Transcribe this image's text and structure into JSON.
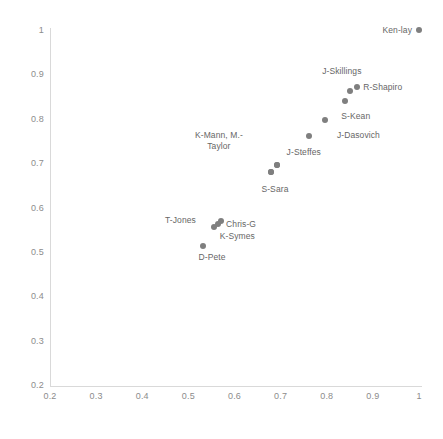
{
  "chart_data": {
    "type": "scatter",
    "title": "",
    "xlabel": "",
    "ylabel": "",
    "xlim": [
      0.2,
      1.0
    ],
    "ylim": [
      0.2,
      1.0
    ],
    "grid": false,
    "legend": "none",
    "marker_color": "#7f7f7f",
    "x_ticks": [
      "0.2",
      "0.3",
      "0.4",
      "0.5",
      "0.6",
      "0.7",
      "0.8",
      "0.9",
      "1"
    ],
    "x_tick_values": [
      0.2,
      0.3,
      0.4,
      0.5,
      0.6,
      0.7,
      0.8,
      0.9,
      1.0
    ],
    "y_ticks": [
      "0.2",
      "0.3",
      "0.4",
      "0.5",
      "0.6",
      "0.7",
      "0.8",
      "0.9",
      "1"
    ],
    "y_tick_values": [
      0.2,
      0.3,
      0.4,
      0.5,
      0.6,
      0.7,
      0.8,
      0.9,
      1.0
    ],
    "points": [
      {
        "label": "Ken-lay",
        "x": 1.0,
        "y": 1.0,
        "label_pos": "left",
        "label_dx": -7,
        "label_dy": 0
      },
      {
        "label": "R-Shapiro",
        "x": 0.866,
        "y": 0.872,
        "label_pos": "right",
        "label_dx": 6,
        "label_dy": 0
      },
      {
        "label": "J-Skillings",
        "x": 0.85,
        "y": 0.863,
        "label_pos": "center",
        "label_dx": -8,
        "label_dy": -20
      },
      {
        "label": "S-Kean",
        "x": 0.839,
        "y": 0.84,
        "label_pos": "center",
        "label_dx": 11,
        "label_dy": 15
      },
      {
        "label": "J-Dasovich",
        "x": 0.796,
        "y": 0.797,
        "label_pos": "right",
        "label_dx": 12,
        "label_dy": 15
      },
      {
        "label": "J-Steffes",
        "x": 0.761,
        "y": 0.762,
        "label_pos": "center",
        "label_dx": -5,
        "label_dy": 16
      },
      {
        "label": "K-Mann, M.-\nTaylor",
        "x": 0.692,
        "y": 0.695,
        "label_pos": "center",
        "label_dx": -58,
        "label_dy": -24
      },
      {
        "label": "S-Sara",
        "x": 0.679,
        "y": 0.68,
        "label_pos": "center",
        "label_dx": 4,
        "label_dy": 17
      },
      {
        "label": "Chris-G",
        "x": 0.571,
        "y": 0.569,
        "label_pos": "right",
        "label_dx": 5,
        "label_dy": 3
      },
      {
        "label": "T-Jones",
        "x": 0.564,
        "y": 0.563,
        "label_pos": "left",
        "label_dx": -22,
        "label_dy": -4
      },
      {
        "label": "K-Symes",
        "x": 0.555,
        "y": 0.556,
        "label_pos": "right",
        "label_dx": 6,
        "label_dy": 9
      },
      {
        "label": "D-Pete",
        "x": 0.532,
        "y": 0.513,
        "label_pos": "center",
        "label_dx": 9,
        "label_dy": 11
      }
    ],
    "extra_markers": [
      {
        "x": 0.692,
        "y": 0.695
      },
      {
        "x": 0.679,
        "y": 0.68
      }
    ]
  }
}
